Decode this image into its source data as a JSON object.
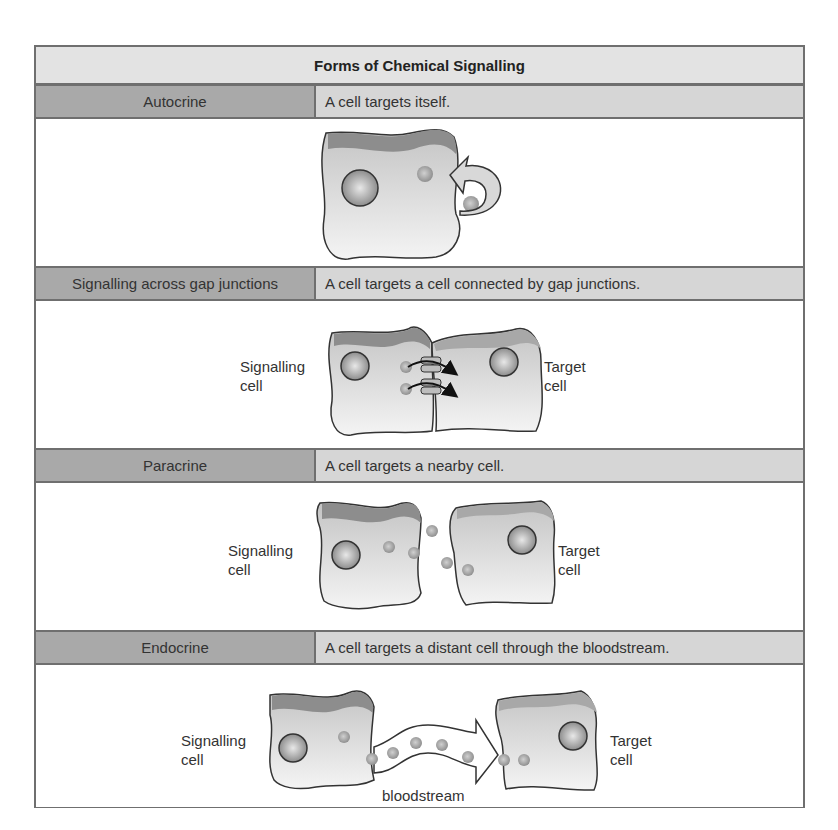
{
  "title": "Forms of Chemical Signalling",
  "rows": [
    {
      "name": "Autocrine",
      "description": "A cell targets itself.",
      "labels": {}
    },
    {
      "name": "Signalling across gap junctions",
      "description": "A cell targets a cell connected by gap junctions.",
      "labels": {
        "left_line1": "Signalling",
        "left_line2": "cell",
        "right_line1": "Target",
        "right_line2": "cell"
      }
    },
    {
      "name": "Paracrine",
      "description": "A cell targets a nearby cell.",
      "labels": {
        "left_line1": "Signalling",
        "left_line2": "cell",
        "right_line1": "Target",
        "right_line2": "cell"
      }
    },
    {
      "name": "Endocrine",
      "description": "A cell targets a distant cell through the bloodstream.",
      "labels": {
        "left_line1": "Signalling",
        "left_line2": "cell",
        "right_line1": "Target",
        "right_line2": "cell",
        "bloodstream": "bloodstream"
      }
    }
  ],
  "colors": {
    "border": "#6f6f6f",
    "title_bg": "#e3e3e3",
    "name_bg": "#a9a9a9",
    "desc_bg": "#d6d6d6",
    "cell_fill": "#d9d9d9",
    "cell_top": "#8a8a8a"
  }
}
